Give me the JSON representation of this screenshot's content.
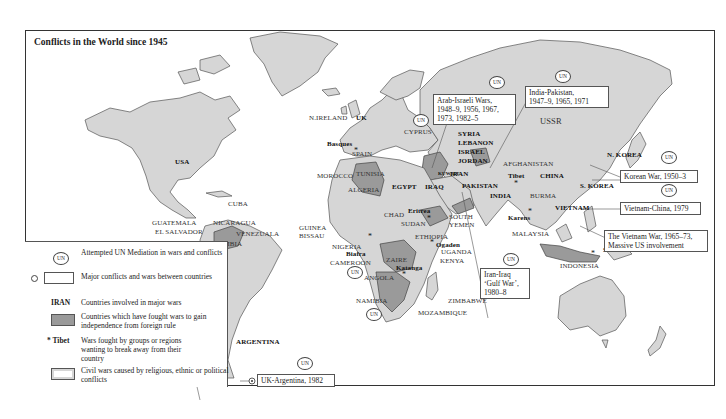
{
  "map": {
    "title": "Conflicts in the World since 1945",
    "colors": {
      "land": "#d6d6d6",
      "independence_wars": "#9a9a9a",
      "border": "#333333",
      "background": "#ffffff"
    },
    "country_labels": [
      {
        "id": "usa",
        "text": "USA",
        "bold": true
      },
      {
        "id": "ussr",
        "text": "USSR",
        "bold": false
      },
      {
        "id": "china",
        "text": "CHINA",
        "bold": true
      },
      {
        "id": "india",
        "text": "INDIA",
        "bold": true
      },
      {
        "id": "pakistan",
        "text": "PAKISTAN",
        "bold": true
      },
      {
        "id": "afghanistan",
        "text": "AFGHANISTAN",
        "bold": false
      },
      {
        "id": "iran",
        "text": "IRAN",
        "bold": true
      },
      {
        "id": "iraq",
        "text": "IRAQ",
        "bold": true
      },
      {
        "id": "kuwait",
        "text": "KUWAIT",
        "bold": true
      },
      {
        "id": "syria",
        "text": "SYRIA",
        "bold": true
      },
      {
        "id": "lebanon",
        "text": "LEBANON",
        "bold": true
      },
      {
        "id": "israel",
        "text": "ISRAEL",
        "bold": true
      },
      {
        "id": "jordan",
        "text": "JORDAN",
        "bold": true
      },
      {
        "id": "egypt",
        "text": "EGYPT",
        "bold": true
      },
      {
        "id": "cyprus",
        "text": "CYPRUS",
        "bold": false
      },
      {
        "id": "n_ireland",
        "text": "N.IRELAND",
        "bold": false
      },
      {
        "id": "uk",
        "text": "UK",
        "bold": true
      },
      {
        "id": "spain",
        "text": "SPAIN",
        "bold": false
      },
      {
        "id": "morocco",
        "text": "MOROCCO",
        "bold": false
      },
      {
        "id": "tunisia",
        "text": "TUNISIA",
        "bold": false
      },
      {
        "id": "algeria",
        "text": "ALGERIA",
        "bold": false
      },
      {
        "id": "chad",
        "text": "CHAD",
        "bold": false
      },
      {
        "id": "sudan",
        "text": "SUDAN",
        "bold": false
      },
      {
        "id": "ethiopia",
        "text": "ETHIOPIA",
        "bold": false
      },
      {
        "id": "south_yemen",
        "text": "SOUTH YEMEN",
        "bold": false
      },
      {
        "id": "uganda",
        "text": "UGANDA",
        "bold": false
      },
      {
        "id": "kenya",
        "text": "KENYA",
        "bold": false
      },
      {
        "id": "nigeria",
        "text": "NIGERIA",
        "bold": false
      },
      {
        "id": "cameroon",
        "text": "CAMEROON",
        "bold": false
      },
      {
        "id": "guinea_bissau",
        "text": "GUINEA BISSAU",
        "bold": false
      },
      {
        "id": "zaire",
        "text": "ZAIRE",
        "bold": false
      },
      {
        "id": "angola",
        "text": "ANGOLA",
        "bold": false
      },
      {
        "id": "namibia",
        "text": "NAMIBIA",
        "bold": false
      },
      {
        "id": "zimbabwe",
        "text": "ZIMBABWE",
        "bold": false
      },
      {
        "id": "mozambique",
        "text": "MOZAMBIQUE",
        "bold": false
      },
      {
        "id": "cuba",
        "text": "CUBA",
        "bold": false
      },
      {
        "id": "guatemala",
        "text": "GUATEMALA",
        "bold": false
      },
      {
        "id": "el_salvador",
        "text": "EL SALVADOR",
        "bold": false
      },
      {
        "id": "nicaragua",
        "text": "NICARAGUA",
        "bold": false
      },
      {
        "id": "colombia",
        "text": "COLOMBIA",
        "bold": false
      },
      {
        "id": "venezuala",
        "text": "VENEZUALA",
        "bold": false
      },
      {
        "id": "argentina",
        "text": "ARGENTINA",
        "bold": true
      },
      {
        "id": "burma",
        "text": "BURMA",
        "bold": false
      },
      {
        "id": "vietnam",
        "text": "VIETNAM",
        "bold": true
      },
      {
        "id": "malaysia",
        "text": "MALAYSIA",
        "bold": false
      },
      {
        "id": "indonesia",
        "text": "INDONESIA",
        "bold": false
      },
      {
        "id": "n_korea",
        "text": "N. KOREA",
        "bold": true
      },
      {
        "id": "s_korea",
        "text": "S. KOREA",
        "bold": true
      }
    ],
    "separatist_regions": [
      {
        "id": "basques",
        "text": "Basques"
      },
      {
        "id": "tibet",
        "text": "Tibet"
      },
      {
        "id": "eritrea",
        "text": "Eritrea"
      },
      {
        "id": "ogaden",
        "text": "Ogaden"
      },
      {
        "id": "biafra",
        "text": "Biafra"
      },
      {
        "id": "katanga",
        "text": "Katanga"
      },
      {
        "id": "karens",
        "text": "Karens"
      },
      {
        "id": "south_moluccas",
        "text": "South Moluccas"
      }
    ],
    "conflict_boxes": [
      {
        "id": "arab_israeli",
        "lines": [
          "Arab-Israeli Wars,",
          "1948–9, 1956, 1967,",
          "1973, 1982–5"
        ],
        "un": true
      },
      {
        "id": "india_pakistan",
        "lines": [
          "India-Pakistan,",
          "1947–9, 1965, 1971"
        ],
        "un": true
      },
      {
        "id": "korean_war",
        "lines": [
          "Korean War, 1950–3"
        ],
        "un": true
      },
      {
        "id": "vietnam_china",
        "lines": [
          "Vietnam-China, 1979"
        ],
        "un": true
      },
      {
        "id": "vietnam_war",
        "lines": [
          "The Vietnam War, 1965–73,",
          "Massive US involvement"
        ],
        "un": false
      },
      {
        "id": "iran_iraq",
        "lines": [
          "Iran-Iraq",
          "‘Gulf War’,",
          "1980–8"
        ],
        "un": true
      },
      {
        "id": "uk_argentina",
        "lines": [
          "UK-Argentina, 1982"
        ],
        "un": true
      }
    ],
    "un_badge_text": "UN",
    "separatist_marker": "*"
  },
  "legend": {
    "items": [
      {
        "id": "un_mediation",
        "symbol": "un-badge",
        "symbol_text": "UN",
        "text": "Attempted UN Mediation in wars and conflicts"
      },
      {
        "id": "major_conflicts",
        "symbol": "box-with-pin",
        "text": "Major conflicts and wars between countries"
      },
      {
        "id": "countries_major_wars",
        "symbol": "bold-label",
        "symbol_text": "IRAN",
        "text": "Countries involved in major wars"
      },
      {
        "id": "independence",
        "symbol": "dark-swatch",
        "text": "Countries which have fought wars to gain independence from foreign rule"
      },
      {
        "id": "separatist",
        "symbol": "star-label",
        "symbol_text": "Tibet",
        "text": "Wars fought by groups or regions wanting to break away from their country"
      },
      {
        "id": "civil_wars",
        "symbol": "outlined-swatch",
        "text": "Civil wars caused by religious, ethnic or political conflicts"
      }
    ]
  }
}
